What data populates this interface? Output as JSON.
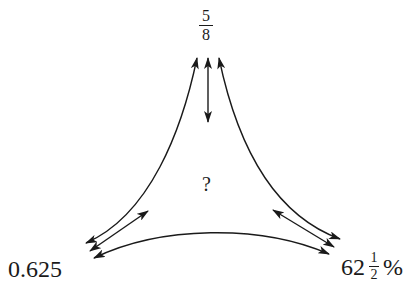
{
  "diagram": {
    "nodes": {
      "top": {
        "numerator": "5",
        "denominator": "8",
        "kind": "fraction"
      },
      "left": {
        "text": "0.625",
        "kind": "decimal"
      },
      "right": {
        "whole": "62",
        "numerator": "1",
        "denominator": "2",
        "suffix": "%",
        "kind": "percent"
      },
      "center": {
        "text": "?"
      }
    },
    "arrows": [
      {
        "from": "top",
        "to": "left",
        "type": "double-headed",
        "shape": "curved"
      },
      {
        "from": "top",
        "to": "right",
        "type": "double-headed",
        "shape": "curved"
      },
      {
        "from": "left",
        "to": "right",
        "type": "double-headed",
        "shape": "curved"
      },
      {
        "from": "top",
        "to": "center",
        "type": "double-headed",
        "shape": "straight"
      },
      {
        "from": "left",
        "to": "center",
        "type": "double-headed",
        "shape": "straight"
      },
      {
        "from": "right",
        "to": "center",
        "type": "double-headed",
        "shape": "straight"
      }
    ],
    "colors": {
      "ink": "#1a1a1a",
      "background": "#ffffff"
    }
  }
}
